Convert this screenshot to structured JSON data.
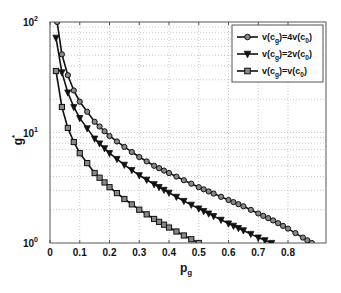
{
  "chart_data": {
    "type": "line",
    "title": "",
    "xlabel": "p_g",
    "ylabel": "g*",
    "xlim": [
      0,
      0.93
    ],
    "ylim": [
      1,
      100
    ],
    "yscale": "log",
    "grid": true,
    "legend_position": "upper right",
    "x_ticks": [
      "0",
      "0.1",
      "0.2",
      "0.3",
      "0.4",
      "0.5",
      "0.6",
      "0.7",
      "0.8"
    ],
    "y_ticks": [
      "10^0",
      "10^1",
      "10^2"
    ],
    "series": [
      {
        "name": "v(c_g)=4v(c_0)",
        "marker": "circle",
        "points": [
          [
            0.024,
            100
          ],
          [
            0.04,
            51
          ],
          [
            0.06,
            33
          ],
          [
            0.08,
            24
          ],
          [
            0.1,
            19
          ],
          [
            0.15,
            12.5
          ],
          [
            0.2,
            9.3
          ],
          [
            0.25,
            7.4
          ],
          [
            0.3,
            6.0
          ],
          [
            0.35,
            5.0
          ],
          [
            0.4,
            4.3
          ],
          [
            0.45,
            3.7
          ],
          [
            0.5,
            3.2
          ],
          [
            0.55,
            2.8
          ],
          [
            0.6,
            2.45
          ],
          [
            0.65,
            2.15
          ],
          [
            0.7,
            1.85
          ],
          [
            0.75,
            1.6
          ],
          [
            0.8,
            1.35
          ],
          [
            0.85,
            1.12
          ],
          [
            0.88,
            1.0
          ]
        ]
      },
      {
        "name": "v(c_g)=2v(c_0)",
        "marker": "triangle-down",
        "points": [
          [
            0.02,
            72
          ],
          [
            0.04,
            35
          ],
          [
            0.06,
            23
          ],
          [
            0.08,
            17
          ],
          [
            0.1,
            13.5
          ],
          [
            0.15,
            8.8
          ],
          [
            0.2,
            6.5
          ],
          [
            0.25,
            5.1
          ],
          [
            0.3,
            4.1
          ],
          [
            0.35,
            3.4
          ],
          [
            0.4,
            2.85
          ],
          [
            0.45,
            2.4
          ],
          [
            0.5,
            2.05
          ],
          [
            0.55,
            1.75
          ],
          [
            0.6,
            1.5
          ],
          [
            0.65,
            1.3
          ],
          [
            0.7,
            1.12
          ],
          [
            0.745,
            1.0
          ]
        ]
      },
      {
        "name": "v(c_g)=v(c_0)",
        "marker": "square",
        "points": [
          [
            0.02,
            36
          ],
          [
            0.04,
            17
          ],
          [
            0.06,
            11
          ],
          [
            0.08,
            8.2
          ],
          [
            0.1,
            6.5
          ],
          [
            0.15,
            4.3
          ],
          [
            0.2,
            3.2
          ],
          [
            0.25,
            2.5
          ],
          [
            0.3,
            2.0
          ],
          [
            0.35,
            1.65
          ],
          [
            0.4,
            1.38
          ],
          [
            0.45,
            1.17
          ],
          [
            0.5,
            1.0
          ]
        ]
      }
    ]
  },
  "labels": {
    "xlabel_main": "p",
    "xlabel_sub": "g",
    "ylabel_main": "g",
    "ylabel_sup": "*",
    "y_tick_base": "10",
    "y_tick_exps": [
      "0",
      "1",
      "2"
    ],
    "legend": [
      {
        "pre": "v(c",
        "sub1": "g",
        "mid": ")=4v(c",
        "sub2": "0",
        "post": ")"
      },
      {
        "pre": "v(c",
        "sub1": "g",
        "mid": ")=2v(c",
        "sub2": "0",
        "post": ")"
      },
      {
        "pre": "v(c",
        "sub1": "g",
        "mid": ")=v(c",
        "sub2": "0",
        "post": ")"
      }
    ]
  }
}
